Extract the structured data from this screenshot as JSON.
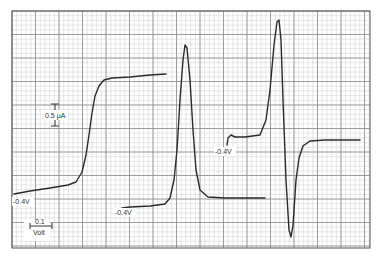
{
  "chart_data": {
    "type": "line",
    "title": "",
    "xlabel": "Potential (scale bar 0.1 Volt)",
    "ylabel": "Current (scale bar 0.5 μA)",
    "grid": true,
    "legend": "none",
    "scale_bars": {
      "current": "0.5 μA",
      "voltage_value": "0.1",
      "voltage_unit": "Volt"
    },
    "annotations": [
      {
        "text": "-0.4V",
        "x": 13,
        "y": 203
      },
      {
        "text": "-0.4V",
        "x": 115,
        "y": 214
      },
      {
        "text": "-0.4V",
        "x": 215,
        "y": 153
      }
    ],
    "series": [
      {
        "name": "DC polarogram (sigmoidal wave)",
        "start_label": "-0.4V",
        "points": [
          [
            14,
            194
          ],
          [
            30,
            191
          ],
          [
            50,
            188
          ],
          [
            68,
            185
          ],
          [
            76,
            182
          ],
          [
            82,
            172
          ],
          [
            86,
            155
          ],
          [
            89,
            135
          ],
          [
            92,
            113
          ],
          [
            95,
            96
          ],
          [
            99,
            86
          ],
          [
            104,
            80
          ],
          [
            112,
            78
          ],
          [
            130,
            77
          ],
          [
            150,
            75
          ],
          [
            166,
            74
          ]
        ]
      },
      {
        "name": "Differential pulse (peak)",
        "start_label": "-0.4V",
        "points": [
          [
            119,
            216
          ],
          [
            119,
            210
          ],
          [
            122,
            208
          ],
          [
            130,
            207
          ],
          [
            150,
            206
          ],
          [
            165,
            204
          ],
          [
            170,
            198
          ],
          [
            174,
            180
          ],
          [
            177,
            150
          ],
          [
            180,
            100
          ],
          [
            183,
            60
          ],
          [
            185,
            45
          ],
          [
            187,
            48
          ],
          [
            190,
            80
          ],
          [
            193,
            130
          ],
          [
            196,
            170
          ],
          [
            200,
            190
          ],
          [
            208,
            197
          ],
          [
            225,
            198
          ],
          [
            265,
            198
          ]
        ]
      },
      {
        "name": "Derivative (first harmonic)",
        "start_label": "-0.4V",
        "points": [
          [
            227,
            145
          ],
          [
            228,
            138
          ],
          [
            231,
            135
          ],
          [
            235,
            137
          ],
          [
            245,
            137
          ],
          [
            260,
            135
          ],
          [
            266,
            120
          ],
          [
            270,
            90
          ],
          [
            274,
            45
          ],
          [
            277,
            22
          ],
          [
            279,
            20
          ],
          [
            281,
            40
          ],
          [
            283,
            100
          ],
          [
            286,
            180
          ],
          [
            289,
            230
          ],
          [
            291,
            237
          ],
          [
            293,
            225
          ],
          [
            296,
            180
          ],
          [
            299,
            158
          ],
          [
            303,
            146
          ],
          [
            310,
            141
          ],
          [
            325,
            140
          ],
          [
            360,
            140
          ]
        ]
      }
    ]
  },
  "frame": {
    "left": 12,
    "top": 11,
    "right": 370,
    "bottom": 248,
    "major_step": 23.5,
    "minor_step": 4.7
  },
  "colors": {
    "trace": "#2a2a2a",
    "major_grid": "#8a8a8a",
    "minor_grid": "#cfcfcf",
    "border": "#555555"
  }
}
